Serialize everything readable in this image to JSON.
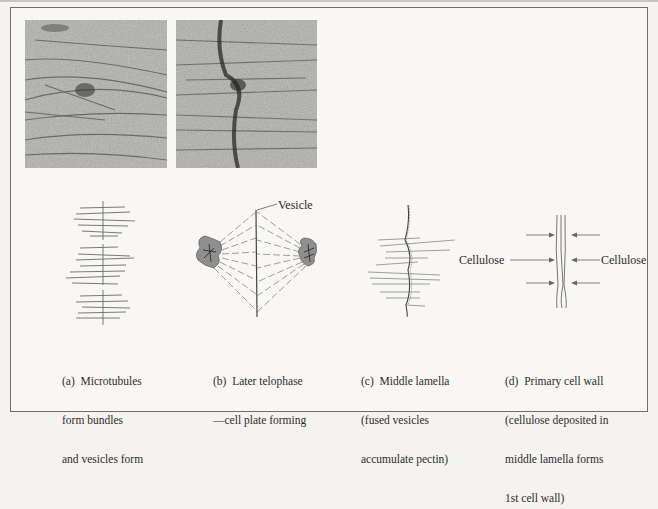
{
  "figure": {
    "micrographs": [
      {
        "id": "micrograph-left",
        "description": "electron micrograph of microtubule bundles"
      },
      {
        "id": "micrograph-right",
        "description": "electron micrograph of forming cell plate"
      }
    ],
    "panels": [
      {
        "key": "a",
        "caption_lines": [
          "(a)  Microtubules",
          "form bundles",
          "and vesicles form"
        ]
      },
      {
        "key": "b",
        "caption_lines": [
          "(b)  Later telophase",
          "—cell plate forming"
        ],
        "label": "Vesicle"
      },
      {
        "key": "c",
        "caption_lines": [
          "(c)  Middle lamella",
          "(fused vesicles",
          "accumulate pectin)"
        ]
      },
      {
        "key": "d",
        "caption_lines": [
          "(d)  Primary cell wall",
          "(cellulose deposited in",
          "middle lamella forms",
          "1st cell wall)"
        ],
        "labels": {
          "left": "Cellulose",
          "right": "Cellulose"
        }
      }
    ]
  },
  "colors": {
    "frame": "#6e6e6e",
    "micrograph_base": "#a9a9a5",
    "nucleus_fill": "#8f8f8f",
    "line": "#555555"
  }
}
